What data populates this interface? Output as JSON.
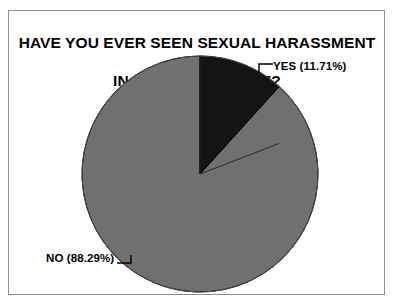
{
  "figure": {
    "background_color": "#ffffff",
    "frame_color": "#8d8d8d"
  },
  "title": {
    "line1": "HAVE YOU EVER SEEN SEXUAL HARASSMENT",
    "line2": "IN THE WORKPLACE?"
  },
  "labels": {
    "yes": "YES (11.71%)",
    "no": "NO (88.29%)"
  },
  "chart_data": {
    "type": "pie",
    "title": "HAVE YOU EVER SEEN SEXUAL HARASSMENT IN THE WORKPLACE?",
    "xlabel": "",
    "ylabel": "",
    "categories": [
      "YES",
      "NO"
    ],
    "values": [
      11.71,
      88.29
    ],
    "value_unit": "percent",
    "labels": [
      "YES (11.71%)",
      "NO (88.29%)"
    ],
    "colors": [
      "#141414",
      "#707070"
    ],
    "slice_edge_color": "#000000",
    "start_angle_deg": 90,
    "direction": "clockwise",
    "center": [
      200,
      174
    ],
    "radius": 118,
    "legend": "none",
    "grid": false,
    "annotations": [
      {
        "text": "YES (11.71%)",
        "leader": "bracket-left",
        "position": "outside-right-top"
      },
      {
        "text": "NO (88.29%)",
        "leader": "bracket-right",
        "position": "outside-left-bottom"
      }
    ]
  }
}
